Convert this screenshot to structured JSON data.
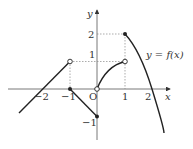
{
  "figure": {
    "function_label": "y = f(x)",
    "axis_x_label": "x",
    "axis_y_label": "y",
    "origin_label": "O",
    "x_ticks": [
      "−2",
      "−1",
      "1",
      "2"
    ],
    "y_ticks": [
      "2",
      "1",
      "−1"
    ],
    "pieces": [
      {
        "type": "line",
        "from": [
          -2.8,
          -0.9
        ],
        "to": [
          -1,
          1
        ],
        "end_open": true
      },
      {
        "type": "line",
        "from": [
          -1,
          0
        ],
        "to": [
          0,
          -1
        ],
        "start_filled": true,
        "end_filled": true
      },
      {
        "type": "curve",
        "from": [
          0,
          0
        ],
        "to": [
          1,
          1
        ],
        "start_open": true,
        "end_open": true
      },
      {
        "type": "curve",
        "from": [
          1,
          2
        ],
        "to": [
          2.7,
          -1.6
        ],
        "start_filled": true
      }
    ],
    "colors": {
      "stroke": "#222222",
      "guide": "#888888"
    }
  }
}
